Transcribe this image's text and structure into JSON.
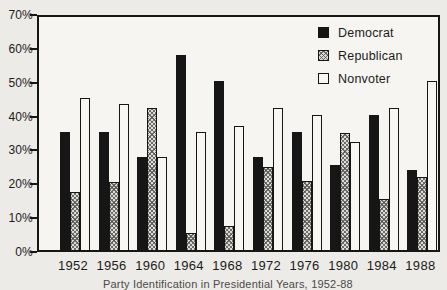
{
  "colors": {
    "democrat": "#161616",
    "republican": "#dedcd7",
    "nonvoter": "#f8f7f4",
    "frame": "#161616",
    "background": "#edebe7",
    "plot_background": "#f6f5f1"
  },
  "axis": {
    "y_tick_labels": [
      "70%",
      "60%",
      "50%",
      "40%",
      "30%",
      "20%",
      "10%",
      "0%"
    ],
    "y_max": 70,
    "y_step": 10
  },
  "legend": {
    "position": "top-right",
    "items": [
      {
        "label": "Democrat",
        "key": "democrat"
      },
      {
        "label": "Republican",
        "key": "republican"
      },
      {
        "label": "Nonvoter",
        "key": "nonvoter"
      }
    ]
  },
  "caption_partial": "Party Identification in Presidential Years, 1952-88",
  "chart_data": {
    "type": "bar",
    "title": "",
    "xlabel": "",
    "ylabel": "",
    "ylim": [
      0,
      70
    ],
    "grid": false,
    "legend_position": "top-right",
    "categories": [
      "1952",
      "1956",
      "1960",
      "1964",
      "1968",
      "1972",
      "1976",
      "1980",
      "1984",
      "1988"
    ],
    "series": [
      {
        "name": "Democrat",
        "key": "democrat",
        "values": [
          35,
          35,
          27.5,
          57.5,
          50,
          27.5,
          35,
          25,
          40,
          23.5
        ]
      },
      {
        "name": "Republican",
        "key": "republican",
        "values": [
          17,
          20,
          42,
          5,
          7,
          24.5,
          20.5,
          34.5,
          15,
          21.5
        ]
      },
      {
        "name": "Nonvoter",
        "key": "nonvoter",
        "values": [
          45,
          43,
          27.5,
          35,
          36.5,
          42,
          40,
          32,
          42,
          50
        ]
      }
    ]
  }
}
